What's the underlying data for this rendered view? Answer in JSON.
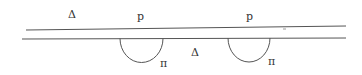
{
  "diagram": {
    "labels": {
      "delta_top": "Δ",
      "p_left": "p",
      "p_right": "p",
      "delta_bottom": "Δ",
      "pi_left": "π",
      "pi_right": "π"
    },
    "colors": {
      "line": "#555555",
      "text": "#333333",
      "background": "#ffffff"
    }
  }
}
